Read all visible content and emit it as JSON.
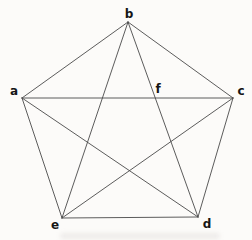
{
  "diagram": {
    "type": "graph",
    "line_color": "#4a4a4a",
    "label_color": "#161616",
    "background_color": "#fcfbf9",
    "vertices": [
      {
        "id": "a",
        "label": "a",
        "x": 22,
        "y": 98,
        "label_x": 14,
        "label_y": 95
      },
      {
        "id": "b",
        "label": "b",
        "x": 128,
        "y": 22,
        "label_x": 129,
        "label_y": 18
      },
      {
        "id": "c",
        "label": "c",
        "x": 233,
        "y": 98,
        "label_x": 241,
        "label_y": 95
      },
      {
        "id": "d",
        "label": "d",
        "x": 198,
        "y": 217,
        "label_x": 207,
        "label_y": 228
      },
      {
        "id": "e",
        "label": "e",
        "x": 62,
        "y": 218,
        "label_x": 55,
        "label_y": 229
      }
    ],
    "points": [
      {
        "id": "f",
        "label": "f",
        "x": 155.3,
        "y": 97.6,
        "label_x": 158,
        "label_y": 93
      }
    ],
    "edges": [
      [
        "a",
        "b"
      ],
      [
        "b",
        "c"
      ],
      [
        "c",
        "d"
      ],
      [
        "d",
        "e"
      ],
      [
        "e",
        "a"
      ],
      [
        "a",
        "c"
      ],
      [
        "a",
        "d"
      ],
      [
        "b",
        "d"
      ],
      [
        "b",
        "e"
      ],
      [
        "c",
        "e"
      ]
    ]
  }
}
